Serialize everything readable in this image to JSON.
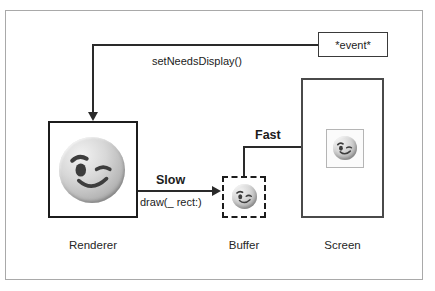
{
  "diagram": {
    "title_visible": false,
    "nodes": {
      "event": {
        "label": "*event*",
        "shape": "rectangle",
        "border": "solid"
      },
      "renderer": {
        "caption": "Renderer",
        "shape": "rectangle",
        "border": "solid",
        "content_icon": "winking-face-emoji"
      },
      "buffer": {
        "caption": "Buffer",
        "shape": "rectangle",
        "border": "dashed",
        "content_icon": "winking-face-emoji"
      },
      "screen": {
        "caption": "Screen",
        "shape": "rectangle",
        "border": "solid",
        "content_icon": "winking-face-emoji"
      }
    },
    "edges": {
      "event_to_renderer": {
        "label": "setNeedsDisplay()",
        "from": "event",
        "to": "renderer"
      },
      "renderer_to_buffer": {
        "label_bold": "Slow",
        "label": "draw(_ rect:)",
        "from": "renderer",
        "to": "buffer"
      },
      "buffer_to_screen": {
        "label_bold": "Fast",
        "from": "buffer",
        "to": "screen"
      }
    },
    "colors": {
      "stroke": "#1c1c1c",
      "frame": "#a9a9a9",
      "text": "#262626",
      "screen_stroke": "#4a4a4a"
    }
  }
}
